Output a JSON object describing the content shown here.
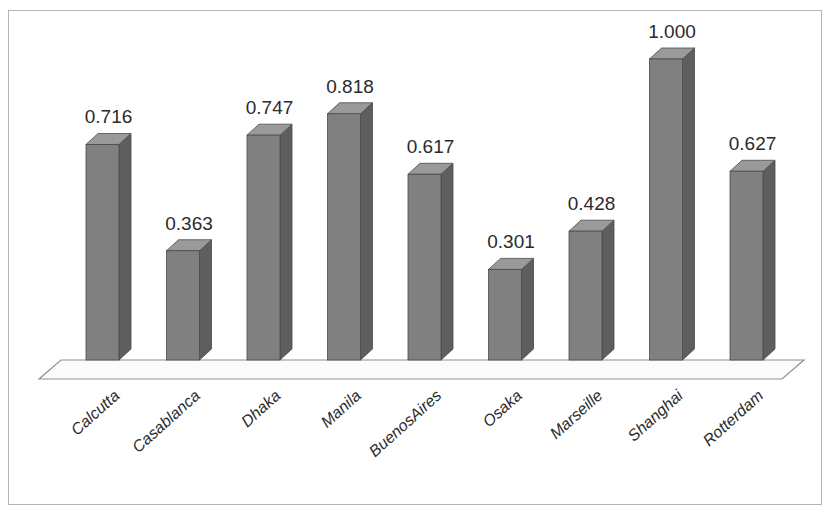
{
  "chart_data": {
    "type": "bar",
    "title": "",
    "subtitle": "",
    "xlabel": "",
    "ylabel": "",
    "ylim": [
      0,
      1.0
    ],
    "grid": false,
    "legend": false,
    "style": "3d-column",
    "categories": [
      "Calcutta",
      "Casablanca",
      "Dhaka",
      "Manila",
      "BuenosAires",
      "Osaka",
      "Marseille",
      "Shanghai",
      "Rotterdam"
    ],
    "values": [
      0.716,
      0.363,
      0.747,
      0.818,
      0.617,
      0.301,
      0.428,
      1.0,
      0.627
    ],
    "value_labels": [
      "0.716",
      "0.363",
      "0.747",
      "0.818",
      "0.617",
      "0.301",
      "0.428",
      "1.000",
      "0.627"
    ]
  },
  "colors": {
    "bar_front": "#808080",
    "bar_side": "#5e5e5e",
    "bar_top": "#9a9a9a",
    "bar_outline": "#4a4a4a",
    "floor_fill": "#fbfbfb",
    "floor_stroke": "#8f8f8f",
    "frame_border": "#b4b4b4",
    "background": "#ffffff",
    "label_text": "#2b2b2b"
  },
  "frame": {
    "border_label": "chart-outer-border"
  }
}
